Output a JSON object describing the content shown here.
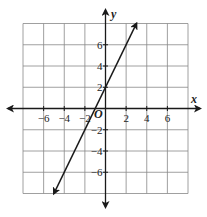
{
  "chart_data": {
    "type": "line",
    "title": "",
    "xlabel": "x",
    "ylabel": "y",
    "origin_label": "O",
    "xlim": [
      -8,
      8
    ],
    "ylim": [
      -8,
      8
    ],
    "grid": true,
    "grid_step": 2,
    "x_ticks": [
      -6,
      -4,
      -2,
      2,
      4,
      6
    ],
    "y_ticks": [
      6,
      4,
      2,
      -2,
      -4,
      -6
    ],
    "x_tick_labels": [
      "−6",
      "−4",
      "−2",
      "2",
      "4",
      "6"
    ],
    "y_tick_labels": [
      "6",
      "4",
      "2",
      "−2",
      "−4",
      "−6"
    ],
    "series": [
      {
        "name": "y = 2x + 2",
        "equation": "y = 2x + 2",
        "slope": 2,
        "intercept": 2,
        "x": [
          -5,
          3
        ],
        "y": [
          -8,
          8
        ],
        "arrows_both_ends": true
      }
    ],
    "line_color": "#1a1a1a",
    "grid_color": "#888888"
  }
}
